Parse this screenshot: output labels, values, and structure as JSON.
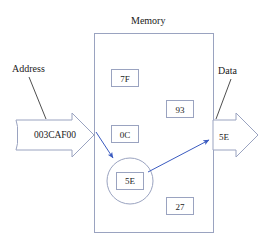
{
  "diagram": {
    "title": "Memory",
    "inputs": {
      "address_label": "Address",
      "address_value": "003CAF00"
    },
    "outputs": {
      "data_label": "Data",
      "data_value": "5E"
    },
    "memory_cells": [
      {
        "id": "cell-7f",
        "value": "7F",
        "highlighted": false
      },
      {
        "id": "cell-93",
        "value": "93",
        "highlighted": false
      },
      {
        "id": "cell-0c",
        "value": "0C",
        "highlighted": false
      },
      {
        "id": "cell-5e",
        "value": "5E",
        "highlighted": true
      },
      {
        "id": "cell-27",
        "value": "27",
        "highlighted": false
      }
    ],
    "colors": {
      "outline": "#9aa3c0",
      "arrow_accent": "#3b5bc0",
      "text": "#1a1a1a",
      "background": "#ffffff"
    }
  }
}
